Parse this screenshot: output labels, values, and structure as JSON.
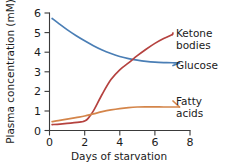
{
  "chart_data": {
    "type": "line",
    "title": "",
    "xlabel": "Days of starvation",
    "ylabel": "Plasma concentration (mM)",
    "xlim": [
      0,
      8
    ],
    "ylim": [
      0,
      6
    ],
    "xticks": [
      0,
      2,
      4,
      6,
      8
    ],
    "yticks": [
      0,
      1,
      2,
      3,
      4,
      5,
      6
    ],
    "xtick_labels": [
      "0",
      "2",
      "4",
      "6",
      "8"
    ],
    "ytick_labels": [
      "0",
      "1",
      "2",
      "3",
      "4",
      "5",
      "6"
    ],
    "grid": false,
    "legend_position": "right-inline-labels",
    "series": [
      {
        "name": "Glucose",
        "color": "#4a7eb5",
        "x": [
          0.15,
          0.5,
          1.0,
          1.5,
          2.0,
          2.5,
          3.0,
          3.5,
          4.0,
          4.5,
          5.0,
          5.5,
          6.0,
          6.5,
          7.0,
          7.4
        ],
        "values": [
          5.72,
          5.48,
          5.15,
          4.85,
          4.58,
          4.33,
          4.11,
          3.93,
          3.78,
          3.67,
          3.59,
          3.53,
          3.49,
          3.47,
          3.46,
          3.45
        ]
      },
      {
        "name": "Ketone bodies",
        "color": "#b5423f",
        "x": [
          0.15,
          0.6,
          1.2,
          1.8,
          2.0,
          2.2,
          2.5,
          3.0,
          3.5,
          4.0,
          4.5,
          5.0,
          5.5,
          6.0,
          6.5,
          7.0
        ],
        "values": [
          0.3,
          0.33,
          0.38,
          0.44,
          0.48,
          0.62,
          1.0,
          1.85,
          2.6,
          3.1,
          3.45,
          3.82,
          4.15,
          4.45,
          4.7,
          4.9
        ]
      },
      {
        "name": "Fatty acids",
        "color": "#d4854a",
        "x": [
          0.15,
          0.5,
          1.0,
          1.5,
          2.0,
          2.5,
          3.0,
          3.5,
          4.0,
          4.5,
          5.0,
          5.5,
          6.0,
          6.5,
          7.0,
          7.4
        ],
        "values": [
          0.45,
          0.5,
          0.58,
          0.66,
          0.74,
          0.85,
          0.96,
          1.05,
          1.12,
          1.17,
          1.2,
          1.21,
          1.21,
          1.2,
          1.2,
          1.2
        ]
      }
    ],
    "annotations": [
      {
        "name": "ketone-bodies",
        "line1": "Ketone",
        "line2": "bodies"
      },
      {
        "name": "glucose",
        "line1": "Glucose",
        "line2": ""
      },
      {
        "name": "fatty-acids",
        "line1": "Fatty",
        "line2": "acids"
      }
    ]
  }
}
